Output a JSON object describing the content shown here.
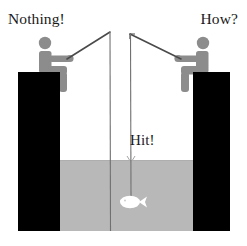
{
  "scene": {
    "title": "Two anglers fishing from opposite piers",
    "canvas": {
      "width": 247,
      "height": 246
    },
    "background_color": "#ffffff",
    "water_color": "#b8b8b8",
    "pier_color": "#000000",
    "figure_color": "#8c8c8c",
    "fish_color": "#ffffff",
    "line_color": "#555555",
    "water_line_y": 160,
    "sea_bed_y": 231
  },
  "captions": {
    "left": "Nothing!",
    "right": "How?",
    "center": "Hit!"
  },
  "figures": {
    "left_angler": {
      "name": "left-angler",
      "rod_tip_x": 110,
      "rod_tip_y": 32,
      "line_end_y": 231,
      "catch": "none"
    },
    "right_angler": {
      "name": "right-angler",
      "rod_tip_x": 130,
      "rod_tip_y": 34,
      "line_end_y": 197,
      "catch": "fish"
    }
  },
  "piers": {
    "left": {
      "x": 18,
      "y": 72,
      "width": 42,
      "height": 159
    },
    "right": {
      "x": 193,
      "y": 72,
      "width": 37,
      "height": 159
    }
  },
  "fish": {
    "label": "caught-fish",
    "x": 131,
    "y": 202,
    "length": 22,
    "color": "#ffffff"
  }
}
